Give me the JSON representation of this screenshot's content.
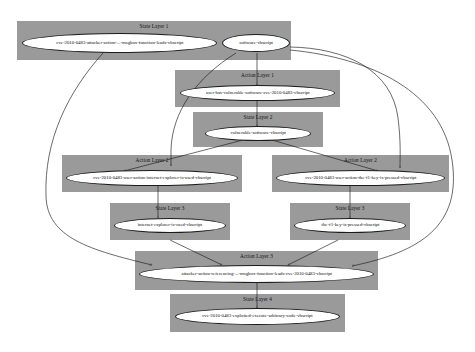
{
  "diagram": {
    "type": "attack-graph",
    "colors": {
      "layer_background": "#9a9a9a",
      "node_fill": "#ffffff",
      "edge": "#1b1b1b",
      "canvas": "#ffffff"
    },
    "layers": [
      {
        "id": "state-layer-1",
        "title": "State Layer 1",
        "kind": "state",
        "nodes": [
          {
            "id": "n1",
            "label": "cve-2010-0483-attacker-action-...-msgbox-function-leads-vbscript"
          },
          {
            "id": "n2",
            "label": "software-vbscript"
          }
        ]
      },
      {
        "id": "action-layer-1",
        "title": "Action Layer 1",
        "kind": "action",
        "nodes": [
          {
            "id": "n3",
            "label": "user-has-vulnerable-software-cve-2010-0483-vbscript"
          }
        ]
      },
      {
        "id": "state-layer-2",
        "title": "State Layer 2",
        "kind": "state",
        "nodes": [
          {
            "id": "n4",
            "label": "vulnerable-software-vbscript"
          }
        ]
      },
      {
        "id": "action-layer-2-left",
        "title": "Action Layer 2",
        "kind": "action",
        "nodes": [
          {
            "id": "n5",
            "label": "cve-2010-0483-user-action-internet-explorer-is-used-vbscript"
          }
        ]
      },
      {
        "id": "action-layer-2-right",
        "title": "Action Layer 2",
        "kind": "action",
        "nodes": [
          {
            "id": "n6",
            "label": "cve-2010-0483-user-action-the-f1-key-is-pressed-vbscript"
          }
        ]
      },
      {
        "id": "state-layer-3-left",
        "title": "State Layer 3",
        "kind": "state",
        "nodes": [
          {
            "id": "n7",
            "label": "internet-explorer-is-used-vbscript"
          }
        ]
      },
      {
        "id": "state-layer-3-right",
        "title": "State Layer 3",
        "kind": "state",
        "nodes": [
          {
            "id": "n8",
            "label": "the-f1-key-is-pressed-vbscript"
          }
        ]
      },
      {
        "id": "action-layer-3",
        "title": "Action Layer 3",
        "kind": "action",
        "nodes": [
          {
            "id": "n9",
            "label": "attacker-action-referencing-...-msgbox-function-leads-cve-2010-0483-vbscript"
          }
        ]
      },
      {
        "id": "state-layer-4",
        "title": "State Layer 4",
        "kind": "state",
        "nodes": [
          {
            "id": "n10",
            "label": "cve-2010-0483-exploited-execute-arbitrary-code-vbscript"
          }
        ]
      }
    ],
    "edges": [
      {
        "from": "n2",
        "to": "n3"
      },
      {
        "from": "n3",
        "to": "n4"
      },
      {
        "from": "n4",
        "to": "n5"
      },
      {
        "from": "n4",
        "to": "n6"
      },
      {
        "from": "n5",
        "to": "n7"
      },
      {
        "from": "n6",
        "to": "n8"
      },
      {
        "from": "n7",
        "to": "n9"
      },
      {
        "from": "n8",
        "to": "n9"
      },
      {
        "from": "n1",
        "to": "n9"
      },
      {
        "from": "n2",
        "to": "n5"
      },
      {
        "from": "n2",
        "to": "n6"
      },
      {
        "from": "n2",
        "to": "n9"
      },
      {
        "from": "n9",
        "to": "n10"
      }
    ]
  }
}
